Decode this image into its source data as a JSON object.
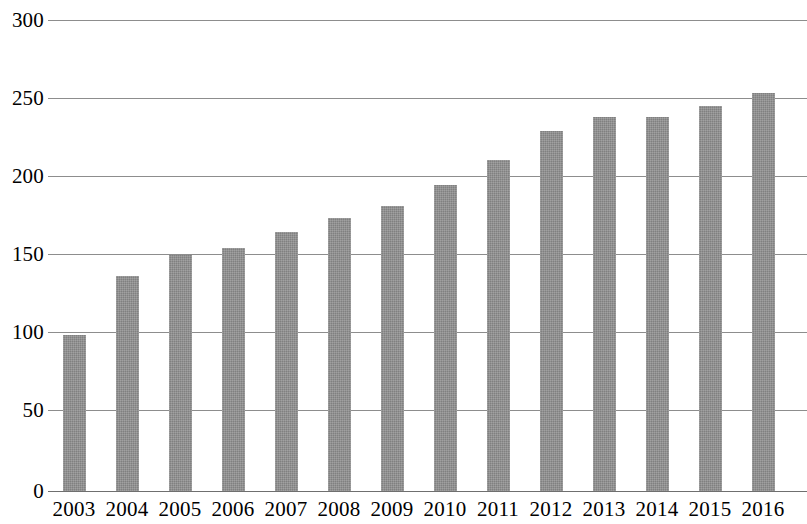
{
  "chart_data": {
    "type": "bar",
    "title": "",
    "subtitle": "",
    "xlabel": "",
    "ylabel": "",
    "categories": [
      "2003",
      "2004",
      "2005",
      "2006",
      "2007",
      "2008",
      "2009",
      "2010",
      "2011",
      "2012",
      "2013",
      "2014",
      "2015",
      "2016"
    ],
    "values": [
      100,
      138,
      151,
      156,
      166,
      175,
      183,
      196,
      212,
      231,
      240,
      240,
      247,
      255
    ],
    "series": [
      {
        "name": "",
        "values": [
          100,
          138,
          151,
          156,
          166,
          175,
          183,
          196,
          212,
          231,
          240,
          240,
          247,
          255
        ]
      }
    ],
    "ylim": [
      0,
      300
    ],
    "yticks": [
      0,
      50,
      100,
      150,
      200,
      250,
      300
    ],
    "ytick_labels": [
      "0",
      "50",
      "100",
      "150",
      "200",
      "250",
      "300"
    ],
    "grid": true,
    "legend": null,
    "legend_position": "none",
    "bar_color": "#8a8a8a",
    "gridline_color": "#8d8d8d",
    "axis_color": "#6f6f6f",
    "background_color": "#ffffff",
    "annotations": []
  }
}
